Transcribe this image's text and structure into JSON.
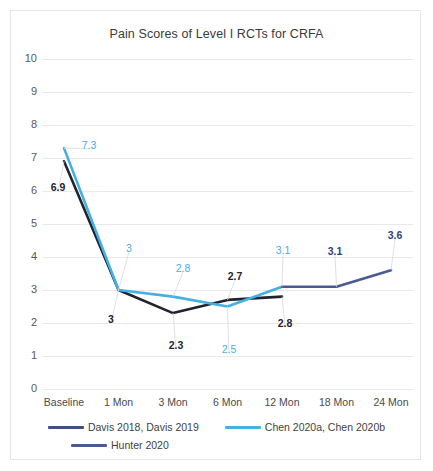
{
  "chart_data": {
    "type": "line",
    "title": "Pain Scores of Level I RCTs for CRFA",
    "xlabel": "",
    "ylabel": "",
    "ylim": [
      0,
      10
    ],
    "ytick_step": 1,
    "grid": true,
    "legend_position": "bottom",
    "categories": [
      "Baseline",
      "1 Mon",
      "3 Mon",
      "6 Mon",
      "12 Mon",
      "18 Mon",
      "24 Mon"
    ],
    "yticks": [
      "10",
      "9",
      "8",
      "7",
      "6",
      "5",
      "4",
      "3",
      "2",
      "1",
      "0"
    ],
    "series": [
      {
        "name": "Davis 2018, Davis 2019",
        "color": "#1f2430",
        "values": [
          6.9,
          3,
          2.3,
          2.7,
          2.8,
          null,
          null
        ],
        "labels": [
          "6.9",
          "3",
          "2.3",
          "2.7",
          "2.8",
          "",
          ""
        ]
      },
      {
        "name": "Chen 2020a, Chen 2020b",
        "color": "#45b0e3",
        "values": [
          7.3,
          3,
          2.8,
          2.5,
          3.1,
          null,
          null
        ],
        "labels": [
          "7.3",
          "3",
          "2.8",
          "2.5",
          "3.1",
          "",
          ""
        ]
      },
      {
        "name": "Hunter 2020",
        "color": "#4a5a96",
        "values": [
          null,
          null,
          null,
          null,
          3.1,
          3.1,
          3.6
        ],
        "labels": [
          "",
          "",
          "",
          "",
          "",
          "3.1",
          "3.6"
        ]
      }
    ],
    "point_labels": [
      {
        "text": "7.3",
        "series": "Chen 2020a, Chen 2020b",
        "category": "Baseline",
        "value": 7.3,
        "color": "#45b0e3",
        "x": 88,
        "y": 144,
        "bold": false
      },
      {
        "text": "6.9",
        "series": "Davis 2018, Davis 2019",
        "category": "Baseline",
        "value": 6.9,
        "color": "#1f2430",
        "x": 57,
        "y": 186,
        "bold": true
      },
      {
        "text": "3",
        "series": "Chen 2020a, Chen 2020b",
        "category": "1 Mon",
        "value": 3,
        "color": "#45b0e3",
        "x": 128,
        "y": 247,
        "bold": false
      },
      {
        "text": "3",
        "series": "Davis 2018, Davis 2019",
        "category": "1 Mon",
        "value": 3,
        "color": "#1f2430",
        "x": 110,
        "y": 318,
        "bold": true
      },
      {
        "text": "2.8",
        "series": "Chen 2020a, Chen 2020b",
        "category": "3 Mon",
        "value": 2.8,
        "color": "#45b0e3",
        "x": 182,
        "y": 267,
        "bold": false
      },
      {
        "text": "2.3",
        "series": "Davis 2018, Davis 2019",
        "category": "3 Mon",
        "value": 2.3,
        "color": "#1f2430",
        "x": 175,
        "y": 344,
        "bold": true
      },
      {
        "text": "2.7",
        "series": "Davis 2018, Davis 2019",
        "category": "6 Mon",
        "value": 2.7,
        "color": "#1f2430",
        "x": 234,
        "y": 275,
        "bold": true
      },
      {
        "text": "2.5",
        "series": "Chen 2020a, Chen 2020b",
        "category": "6 Mon",
        "value": 2.5,
        "color": "#45b0e3",
        "x": 228,
        "y": 348,
        "bold": false
      },
      {
        "text": "3.1",
        "series": "Chen 2020a, Chen 2020b",
        "category": "12 Mon",
        "value": 3.1,
        "color": "#45b0e3",
        "x": 282,
        "y": 249,
        "bold": false
      },
      {
        "text": "2.8",
        "series": "Davis 2018, Davis 2019",
        "category": "12 Mon",
        "value": 2.8,
        "color": "#1f2430",
        "x": 284,
        "y": 322,
        "bold": true
      },
      {
        "text": "3.1",
        "series": "Hunter 2020",
        "category": "18 Mon",
        "value": 3.1,
        "color": "#2f3f7a",
        "x": 334,
        "y": 250,
        "bold": true
      },
      {
        "text": "3.6",
        "series": "Hunter 2020",
        "category": "24 Mon",
        "value": 3.6,
        "color": "#2f3f7a",
        "x": 394,
        "y": 234,
        "bold": true
      }
    ]
  },
  "legend": {
    "items": [
      {
        "label": "Davis 2018, Davis 2019",
        "color": "#3f4f87"
      },
      {
        "label": "Chen 2020a, Chen 2020b",
        "color": "#45b0e3"
      },
      {
        "label": "Hunter 2020",
        "color": "#4a5a96"
      }
    ]
  }
}
